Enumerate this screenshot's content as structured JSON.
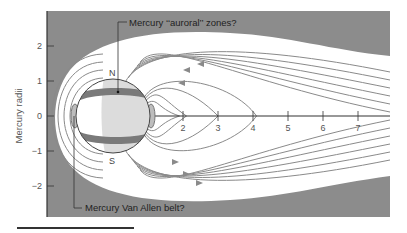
{
  "figure": {
    "ylabel": "Mercury radii",
    "y_ticks": [
      "2",
      "1",
      "0",
      "−1",
      "−2"
    ],
    "y_tick_values": [
      2,
      1,
      0,
      -1,
      -2
    ],
    "x_ticks": [
      "2",
      "3",
      "4",
      "5",
      "6",
      "7"
    ],
    "x_tick_values": [
      2,
      3,
      4,
      5,
      6,
      7
    ],
    "annotations": {
      "auroral": "Mercury ‘‘auroral’’ zones?",
      "van_allen": "Mercury Van Allen belt?"
    },
    "poles": {
      "north": "N",
      "south": "S"
    },
    "colors": {
      "background_space": "#8c8c8c",
      "magnetosphere": "#ffffff",
      "field_lines": "#8a8a8a",
      "planet_fill": "#ffffff",
      "planet_shade": "#dcdcdc",
      "auroral_zone": "#7a7a7a",
      "axis": "#333333",
      "caption_rule": "#333333"
    }
  }
}
